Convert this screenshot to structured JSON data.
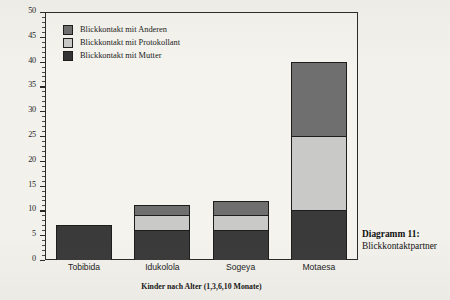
{
  "chart_data": {
    "type": "bar",
    "subtype": "stacked-bar",
    "title": "",
    "xlabel": "Kinder nach Alter (1,3,6,10 Monate)",
    "ylabel": "",
    "categories": [
      "Tobibida",
      "Idukolola",
      "Sogeya",
      "Motaesa"
    ],
    "series": [
      {
        "name": "Blickkontakt mit Mutter",
        "values": [
          7,
          6,
          6,
          10
        ],
        "color": "#3a3a3a"
      },
      {
        "name": "Blickkontakt mit Protokollant",
        "values": [
          0,
          3,
          3,
          15
        ],
        "color": "#c9c9c7"
      },
      {
        "name": "Blickkontakt mit Anderen",
        "values": [
          0,
          2,
          3,
          15
        ],
        "color": "#6f6f6f"
      }
    ],
    "totals": [
      7,
      11,
      12,
      40
    ],
    "ylim": [
      0,
      50
    ],
    "ytick_step": 5,
    "yticks": [
      0,
      5,
      10,
      15,
      20,
      25,
      30,
      35,
      40,
      45,
      50
    ],
    "ytick_labels": [
      "0",
      "5",
      "10",
      "15",
      "20",
      "25",
      "30",
      "35",
      "40",
      "45",
      "50"
    ],
    "minor_tick_step": 1,
    "grid": false,
    "legend_position": "top-left-inside",
    "legend_order": [
      "Blickkontakt mit Anderen",
      "Blickkontakt mit Protokollant",
      "Blickkontakt mit Mutter"
    ]
  },
  "legend": {
    "items": [
      {
        "label": "Blickkontakt mit Anderen",
        "swatch": "#6f6f6f"
      },
      {
        "label": "Blickkontakt mit Protokollant",
        "swatch": "#c9c9c7"
      },
      {
        "label": "Blickkontakt mit Mutter",
        "swatch": "#333333"
      }
    ]
  },
  "caption": {
    "line1": "Diagramm 11:",
    "line2": "Blickkontaktpartner"
  },
  "axis": {
    "x_title": "Kinder nach Alter (1,3,6,10 Monate)",
    "x_labels": [
      "Tobibida",
      "Idukolola",
      "Sogeya",
      "Motaesa"
    ],
    "y_labels": [
      "50",
      "45",
      "40",
      "35",
      "30",
      "25",
      "20",
      "15",
      "10",
      "5",
      "0"
    ]
  },
  "colors": {
    "page_background": "#f2f1ec",
    "plot_background": "#f4f3ee",
    "axis_line": "#2a2a2a",
    "series_mutter": "#3a3a3a",
    "series_protokollant": "#c9c9c7",
    "series_anderen": "#6f6f6f",
    "text": "#1a1a1a"
  }
}
